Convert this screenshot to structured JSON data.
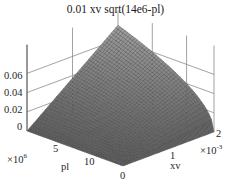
{
  "chart_data": {
    "type": "surface",
    "title": "0.01 xv sqrt(14e6-pl)",
    "function": "z = 0.01 * xv * sqrt(14e6 - pl)",
    "xlabel": "pl",
    "ylabel": "xv",
    "zlabel": "",
    "x_range": [
      0,
      14000000
    ],
    "y_range": [
      0,
      0.002
    ],
    "z_range": [
      0,
      0.075
    ],
    "x_ticks": [
      "5",
      "10"
    ],
    "x_tick_values": [
      5000000,
      10000000
    ],
    "x_multiplier": "×10^6",
    "y_ticks": [
      "0",
      "1",
      "2"
    ],
    "y_tick_values": [
      0,
      0.001,
      0.002
    ],
    "y_multiplier": "×10^-3",
    "z_ticks": [
      "0",
      "0.02",
      "0.04",
      "0.06"
    ],
    "z_tick_values": [
      0,
      0.02,
      0.04,
      0.06
    ],
    "z_max": 0.0748,
    "grid": true,
    "colormap": "gray",
    "mesh_color": "#3c3c3c",
    "face_color_light": "#9a9a9a",
    "face_color_dark": "#5a5a5a",
    "grid_color": "#8c8c8c",
    "mesh_resolution": [
      40,
      40
    ]
  },
  "labels": {
    "title": "0.01 xv sqrt(14e6-pl)",
    "z_ticks": [
      "0.06",
      "0.04",
      "0.02",
      "0"
    ],
    "pl_ticks": [
      "5",
      "10"
    ],
    "pl_multiplier_base": "×10",
    "pl_multiplier_exp": "6",
    "pl_axis": "pl",
    "xv_ticks": [
      "0",
      "1",
      "2"
    ],
    "xv_multiplier_base": "×10",
    "xv_multiplier_exp": "-3",
    "xv_axis": "xv"
  }
}
